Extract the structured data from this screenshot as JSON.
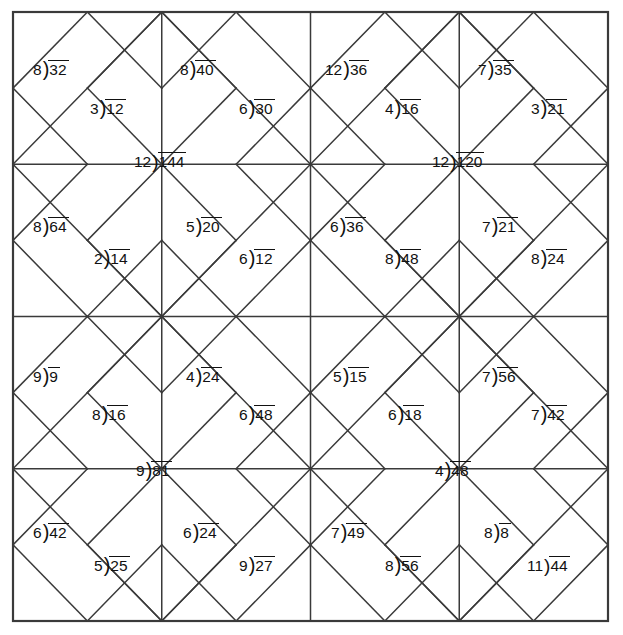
{
  "page": {
    "width": 623,
    "height": 635,
    "background": "#ffffff",
    "line_color": "#3a3a3a",
    "text_color": "#111111"
  },
  "grid": {
    "left": 13,
    "top": 12,
    "right": 608,
    "bottom": 621,
    "blocks_across": 2,
    "blocks_down": 2,
    "cells_per_block": 4,
    "description": "Four square-in-a-square quilt blocks, each divided into a 4x4 cell grid with a large center diamond, corner half-square triangles and small side diamonds. A long-division problem is written in selected regions."
  },
  "problems": [
    {
      "id": "p01",
      "divisor": "8",
      "dividend": "32",
      "x": 33,
      "y": 60,
      "block": "top-left",
      "region": "upper-left-triangle"
    },
    {
      "id": "p02",
      "divisor": "8",
      "dividend": "40",
      "x": 180,
      "y": 60,
      "block": "top-left",
      "region": "upper-right-triangle"
    },
    {
      "id": "p03",
      "divisor": "12",
      "dividend": "36",
      "x": 325,
      "y": 60,
      "block": "top-right",
      "region": "upper-left-triangle"
    },
    {
      "id": "p04",
      "divisor": "7",
      "dividend": "35",
      "x": 478,
      "y": 60,
      "block": "top-right",
      "region": "upper-right-triangle"
    },
    {
      "id": "p05",
      "divisor": "3",
      "dividend": "12",
      "x": 90,
      "y": 99,
      "block": "top-left",
      "region": "center-diamond-top-left"
    },
    {
      "id": "p06",
      "divisor": "6",
      "dividend": "30",
      "x": 239,
      "y": 99,
      "block": "top-left",
      "region": "center-diamond-top-right"
    },
    {
      "id": "p07",
      "divisor": "4",
      "dividend": "16",
      "x": 385,
      "y": 99,
      "block": "top-right",
      "region": "center-diamond-top-left"
    },
    {
      "id": "p08",
      "divisor": "3",
      "dividend": "21",
      "x": 531,
      "y": 99,
      "block": "top-right",
      "region": "center-diamond-top-right"
    },
    {
      "id": "p09",
      "divisor": "12",
      "dividend": "144",
      "x": 134,
      "y": 152,
      "block": "top-left",
      "region": "center-diamond",
      "tight": true
    },
    {
      "id": "p10",
      "divisor": "12",
      "dividend": "120",
      "x": 432,
      "y": 152,
      "block": "top-right",
      "region": "center-diamond",
      "tight": true
    },
    {
      "id": "p11",
      "divisor": "8",
      "dividend": "64",
      "x": 33,
      "y": 217,
      "block": "top-left",
      "region": "lower-left-triangle"
    },
    {
      "id": "p12",
      "divisor": "5",
      "dividend": "20",
      "x": 186,
      "y": 217,
      "block": "top-left",
      "region": "lower-right-triangle"
    },
    {
      "id": "p13",
      "divisor": "6",
      "dividend": "36",
      "x": 330,
      "y": 217,
      "block": "top-right",
      "region": "lower-left-triangle"
    },
    {
      "id": "p14",
      "divisor": "7",
      "dividend": "21",
      "x": 482,
      "y": 217,
      "block": "top-right",
      "region": "lower-right-triangle"
    },
    {
      "id": "p15",
      "divisor": "2",
      "dividend": "14",
      "x": 94,
      "y": 249,
      "block": "top-left",
      "region": "center-diamond-bottom-left"
    },
    {
      "id": "p16",
      "divisor": "6",
      "dividend": "12",
      "x": 239,
      "y": 249,
      "block": "top-left",
      "region": "center-diamond-bottom-right"
    },
    {
      "id": "p17",
      "divisor": "8",
      "dividend": "48",
      "x": 385,
      "y": 249,
      "block": "top-right",
      "region": "center-diamond-bottom-left"
    },
    {
      "id": "p18",
      "divisor": "8",
      "dividend": "24",
      "x": 531,
      "y": 249,
      "block": "top-right",
      "region": "center-diamond-bottom-right"
    },
    {
      "id": "p19",
      "divisor": "9",
      "dividend": "9",
      "x": 33,
      "y": 367,
      "block": "bottom-left",
      "region": "upper-left-triangle"
    },
    {
      "id": "p20",
      "divisor": "4",
      "dividend": "24",
      "x": 186,
      "y": 367,
      "block": "bottom-left",
      "region": "upper-right-triangle"
    },
    {
      "id": "p21",
      "divisor": "5",
      "dividend": "15",
      "x": 333,
      "y": 367,
      "block": "bottom-right",
      "region": "upper-left-triangle"
    },
    {
      "id": "p22",
      "divisor": "7",
      "dividend": "56",
      "x": 482,
      "y": 367,
      "block": "bottom-right",
      "region": "upper-right-triangle"
    },
    {
      "id": "p23",
      "divisor": "8",
      "dividend": "16",
      "x": 92,
      "y": 405,
      "block": "bottom-left",
      "region": "center-diamond-top-left"
    },
    {
      "id": "p24",
      "divisor": "6",
      "dividend": "48",
      "x": 239,
      "y": 405,
      "block": "bottom-left",
      "region": "center-diamond-top-right"
    },
    {
      "id": "p25",
      "divisor": "6",
      "dividend": "18",
      "x": 388,
      "y": 405,
      "block": "bottom-right",
      "region": "center-diamond-top-left"
    },
    {
      "id": "p26",
      "divisor": "7",
      "dividend": "42",
      "x": 531,
      "y": 405,
      "block": "bottom-right",
      "region": "center-diamond-top-right"
    },
    {
      "id": "p27",
      "divisor": "9",
      "dividend": "81",
      "x": 136,
      "y": 461,
      "block": "bottom-left",
      "region": "center-diamond"
    },
    {
      "id": "p28",
      "divisor": "4",
      "dividend": "48",
      "x": 435,
      "y": 461,
      "block": "bottom-right",
      "region": "center-diamond"
    },
    {
      "id": "p29",
      "divisor": "6",
      "dividend": "42",
      "x": 33,
      "y": 523,
      "block": "bottom-left",
      "region": "lower-left-triangle"
    },
    {
      "id": "p30",
      "divisor": "6",
      "dividend": "24",
      "x": 183,
      "y": 523,
      "block": "bottom-left",
      "region": "lower-right-triangle"
    },
    {
      "id": "p31",
      "divisor": "7",
      "dividend": "49",
      "x": 331,
      "y": 523,
      "block": "bottom-right",
      "region": "lower-left-triangle"
    },
    {
      "id": "p32",
      "divisor": "8",
      "dividend": "8",
      "x": 484,
      "y": 523,
      "block": "bottom-right",
      "region": "lower-right-triangle"
    },
    {
      "id": "p33",
      "divisor": "5",
      "dividend": "25",
      "x": 94,
      "y": 556,
      "block": "bottom-left",
      "region": "center-diamond-bottom-left"
    },
    {
      "id": "p34",
      "divisor": "9",
      "dividend": "27",
      "x": 239,
      "y": 556,
      "block": "bottom-left",
      "region": "center-diamond-bottom-right"
    },
    {
      "id": "p35",
      "divisor": "8",
      "dividend": "56",
      "x": 385,
      "y": 556,
      "block": "bottom-right",
      "region": "center-diamond-bottom-left"
    },
    {
      "id": "p36",
      "divisor": "11",
      "dividend": "44",
      "x": 527,
      "y": 556,
      "block": "bottom-right",
      "region": "center-diamond-bottom-right",
      "tight": true
    }
  ]
}
